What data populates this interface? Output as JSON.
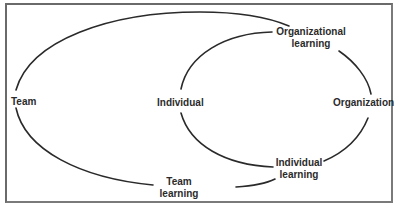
{
  "diagram": {
    "type": "two nested learning cycles",
    "line_color": "#2a2a2a",
    "text_color": "#2b2b2b",
    "border_color": "#6a6a6a",
    "nodes": {
      "team": "Team",
      "individual": "Individual",
      "organization": "Organization",
      "organizational_learning_line1": "Organizational",
      "organizational_learning_line2": "learning",
      "individual_learning_line1": "Individual",
      "individual_learning_line2": "learning",
      "team_learning_line1": "Team",
      "team_learning_line2": "learning"
    },
    "loops": [
      {
        "name": "outer",
        "path": [
          "Team",
          "Organizational learning",
          "Team learning",
          "Team"
        ]
      },
      {
        "name": "inner",
        "path": [
          "Individual",
          "Organizational learning",
          "Organization",
          "Individual learning",
          "Individual"
        ]
      }
    ]
  }
}
